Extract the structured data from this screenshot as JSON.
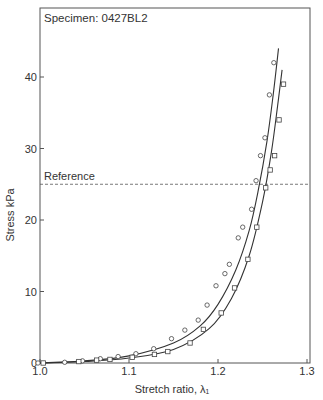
{
  "chart_data": {
    "type": "scatter",
    "title": "Specimen: 0427BL2",
    "xlabel": "Stretch ratio, λ₁",
    "ylabel": "Stress kPa",
    "xlim": [
      1.0,
      1.3
    ],
    "ylim": [
      0,
      45
    ],
    "xticks": [
      1.0,
      1.1,
      1.2,
      1.3
    ],
    "xtick_labels": [
      "1.0",
      "1.1",
      "1.2",
      "1.3"
    ],
    "yticks": [
      0,
      10,
      20,
      30,
      40
    ],
    "ytick_labels": [
      "0",
      "10",
      "20",
      "30",
      "40"
    ],
    "grid": false,
    "reference_line": {
      "label": "Reference",
      "y": 25,
      "style": "dashed"
    },
    "series": [
      {
        "name": "circles",
        "marker": "circle",
        "x": [
          1.0,
          1.03,
          1.05,
          1.07,
          1.09,
          1.11,
          1.13,
          1.15,
          1.165,
          1.18,
          1.19,
          1.2,
          1.21,
          1.215,
          1.225,
          1.23,
          1.24,
          1.245,
          1.25,
          1.255,
          1.26,
          1.265
        ],
        "y": [
          0,
          0.1,
          0.3,
          0.6,
          0.9,
          1.3,
          2.0,
          3.4,
          4.6,
          6.0,
          8.1,
          10.8,
          12.5,
          13.8,
          17.5,
          19.0,
          21.5,
          25.5,
          29.0,
          31.5,
          37.5,
          42.0
        ],
        "fit": {
          "x": [
            1.0,
            1.05,
            1.1,
            1.15,
            1.18,
            1.2,
            1.22,
            1.235,
            1.245,
            1.255,
            1.262,
            1.268
          ],
          "y": [
            0,
            0.3,
            1.0,
            2.8,
            5.2,
            8.2,
            13.0,
            18.5,
            24.0,
            31.0,
            37.5,
            44.0
          ]
        }
      },
      {
        "name": "squares",
        "marker": "square",
        "x": [
          1.0,
          1.04,
          1.06,
          1.075,
          1.1,
          1.125,
          1.14,
          1.165,
          1.18,
          1.2,
          1.215,
          1.23,
          1.24,
          1.25,
          1.255,
          1.26,
          1.265,
          1.27
        ],
        "y": [
          0,
          0.2,
          0.4,
          0.5,
          0.8,
          1.2,
          1.6,
          2.8,
          4.7,
          7.0,
          10.5,
          14.5,
          19.0,
          24.5,
          27.0,
          29.0,
          34.0,
          39.0
        ],
        "fit": {
          "x": [
            1.0,
            1.05,
            1.1,
            1.15,
            1.19,
            1.215,
            1.235,
            1.25,
            1.26,
            1.267,
            1.272
          ],
          "y": [
            0,
            0.2,
            0.7,
            1.9,
            4.8,
            9.0,
            15.0,
            22.5,
            29.5,
            36.0,
            41.0
          ]
        }
      }
    ],
    "legend": "none"
  }
}
